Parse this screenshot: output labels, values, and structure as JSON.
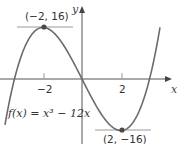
{
  "chart_data": {
    "type": "line",
    "title": "",
    "function_label": "f(x) = x³ − 12x",
    "xlabel": "x",
    "ylabel": "y",
    "x_ticks": [
      -2,
      2
    ],
    "x_tick_labels": [
      "−2",
      "2"
    ],
    "xlim": [
      -4,
      4
    ],
    "ylim": [
      -20,
      20
    ],
    "grid": false,
    "series": [
      {
        "name": "f(x) = x^3 - 12x",
        "x": [
          -4,
          -3.5,
          -3,
          -2.5,
          -2,
          -1.5,
          -1,
          -0.5,
          0,
          0.5,
          1,
          1.5,
          2,
          2.5,
          3,
          3.5,
          4
        ],
        "values": [
          -16,
          1.125,
          9,
          14.375,
          16,
          14.625,
          11,
          5.875,
          0,
          -5.875,
          -11,
          -14.625,
          -16,
          -14.375,
          -9,
          -1.125,
          16
        ]
      }
    ],
    "annotations": [
      {
        "label": "(−2, 16)",
        "x": -2,
        "y": 16,
        "type": "local maximum"
      },
      {
        "label": "(2, −16)",
        "x": 2,
        "y": -16,
        "type": "local minimum"
      }
    ]
  },
  "labels": {
    "y_axis": "y",
    "x_axis": "x",
    "tick_neg2": "−2",
    "tick_pos2": "2",
    "max_point": "(−2, 16)",
    "min_point": "(2, −16)",
    "function": "f(x) = x³ − 12x"
  },
  "colors": {
    "curve": "#6b6b6b",
    "axis": "#555555",
    "tangent": "#9a9a9a",
    "point": "#4a4a4a"
  }
}
